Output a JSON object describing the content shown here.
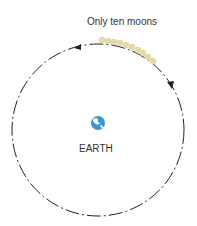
{
  "diagram": {
    "moons_label": "Only ten moons",
    "earth_label": "EARTH",
    "moon_count": 10,
    "colors": {
      "orbit": "#222222",
      "moon": "#e6d9a8",
      "earth": "#3a95d6",
      "text": "#333333"
    }
  }
}
